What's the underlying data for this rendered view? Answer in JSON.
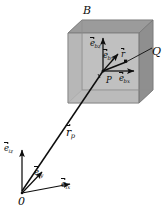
{
  "figure": {
    "background_color": "#ffffff",
    "ink_color": "#0d0d0d",
    "box_top_face_color": "#9a9a9a",
    "box_right_face_color": "#8e8e8e",
    "box_front_face_color": "#b3b3b3",
    "box_interior_color": "#c2c2c2"
  },
  "labels": {
    "body": "B",
    "point_q": "Q",
    "point_p": "P",
    "origin": "0",
    "body_basis_x": {
      "symbol": "e",
      "subscript": "bx",
      "overbar": true
    },
    "body_basis_y": {
      "symbol": "e",
      "subscript": "by",
      "overbar": true
    },
    "body_basis_z": {
      "symbol": "e",
      "subscript": "bz",
      "overbar": true
    },
    "inertial_basis_x": {
      "symbol": "e",
      "subscript": "ix",
      "overbar": true
    },
    "inertial_basis_y": {
      "symbol": "e",
      "subscript": "iy",
      "overbar": true
    },
    "inertial_basis_z": {
      "symbol": "e",
      "subscript": "iz",
      "overbar": true
    },
    "position_vector_p": {
      "symbol": "r",
      "subscript": "p",
      "overbar": true
    },
    "relative_vector_r": {
      "symbol": "r",
      "subscript": "",
      "overbar": true
    }
  },
  "geometry": {
    "box_front_top_left": [
      68,
      33
    ],
    "box_front_bottom_right": [
      139,
      103
    ],
    "box_depth_offset": [
      14,
      -13
    ],
    "point_p": [
      103,
      71
    ],
    "point_q": [
      135,
      61
    ],
    "origin": [
      22,
      193
    ]
  }
}
